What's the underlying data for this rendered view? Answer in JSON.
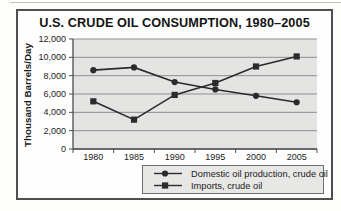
{
  "chart_data": {
    "type": "line",
    "title": "U.S. CRUDE OIL CONSUMPTION, 1980–2005",
    "ylabel": "Thousand Barrels/Day",
    "xlabel": "",
    "categories": [
      "1980",
      "1985",
      "1990",
      "1995",
      "2000",
      "2005"
    ],
    "series": [
      {
        "name": "Domestic oil production, crude oil",
        "marker": "circle",
        "values": [
          8600,
          8900,
          7300,
          6500,
          5800,
          5100
        ]
      },
      {
        "name": "Imports, crude oil",
        "marker": "square",
        "values": [
          5200,
          3200,
          5900,
          7200,
          9000,
          10100
        ]
      }
    ],
    "ylim": [
      0,
      12000
    ],
    "yticks": [
      0,
      2000,
      4000,
      6000,
      8000,
      10000,
      12000
    ],
    "ytick_labels": [
      "0",
      "2,000",
      "4,000",
      "6,000",
      "8,000",
      "10,000",
      "12,000"
    ],
    "grid": true,
    "legend_position": "bottom",
    "colors": {
      "series": "#2b2b2b",
      "plot_background": "#e4e4e3",
      "gridline": "#8f8f8f",
      "axis": "#4d4d4d",
      "frame_border": "#4f4f4f",
      "legend_background": "#e7e7e6"
    }
  }
}
